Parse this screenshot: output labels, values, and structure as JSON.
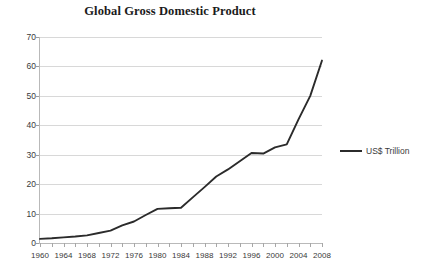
{
  "chart_data": {
    "type": "line",
    "title": "Global Gross Domestic Product",
    "xlabel": "",
    "ylabel": "",
    "ylim": [
      0,
      70
    ],
    "xlim": [
      1960,
      2008
    ],
    "ytick_step": 10,
    "xtick_step": 4,
    "minor_xtick_step": 2,
    "grid": true,
    "legend_position": "right",
    "series": [
      {
        "name": "US$ Trillion",
        "color": "#2b2b2b",
        "x": [
          1960,
          1962,
          1964,
          1966,
          1968,
          1970,
          1972,
          1974,
          1976,
          1978,
          1980,
          1982,
          1984,
          1986,
          1988,
          1990,
          1992,
          1994,
          1996,
          1998,
          2000,
          2002,
          2004,
          2006,
          2008
        ],
        "values": [
          1.4,
          1.6,
          1.9,
          2.2,
          2.6,
          3.4,
          4.2,
          6.0,
          7.3,
          9.5,
          11.6,
          11.8,
          12.0,
          15.5,
          19.0,
          22.6,
          25.0,
          27.8,
          30.6,
          30.4,
          32.5,
          33.5,
          42.0,
          50.0,
          62.0
        ]
      }
    ],
    "ytick_labels": [
      "0",
      "10",
      "20",
      "30",
      "40",
      "50",
      "60",
      "70"
    ],
    "xtick_labels": [
      "1960",
      "1964",
      "1968",
      "1972",
      "1976",
      "1980",
      "1984",
      "1988",
      "1992",
      "1996",
      "2000",
      "2004",
      "2008"
    ],
    "legend_entries": [
      {
        "label": "US$ Trillion",
        "color": "#2b2b2b"
      }
    ]
  }
}
